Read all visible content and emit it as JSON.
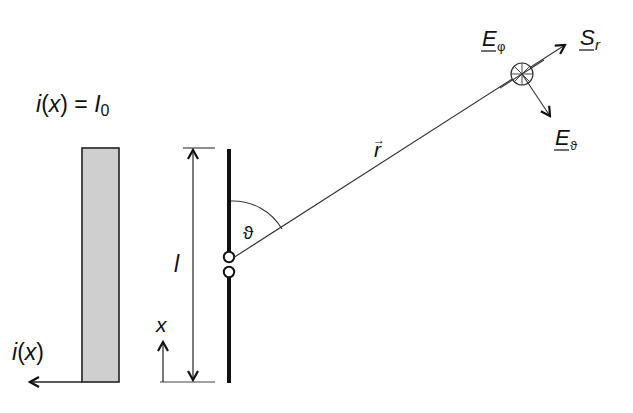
{
  "diagram": {
    "type": "hertzian-dipole-radiation",
    "labels": {
      "current_distribution": "i(x) = I0",
      "current_distribution_parts": {
        "i": "i",
        "x": "x",
        "eq": "=",
        "I": "I",
        "sub": "0"
      },
      "current_axis": "i(x)",
      "current_axis_parts": {
        "i": "i",
        "x": "x"
      },
      "x_axis": "x",
      "length": "l",
      "angle": "ϑ",
      "radius_vector": "r",
      "radius_vector_arrow": "→",
      "poynting": {
        "main": "S",
        "sub": "r"
      },
      "e_phi": {
        "main": "E",
        "sub": "φ"
      },
      "e_theta": {
        "main": "E",
        "sub": "ϑ"
      }
    },
    "colors": {
      "line": "#111111",
      "current_fill": "#cfcfcf",
      "thin_line": "#333333"
    }
  }
}
